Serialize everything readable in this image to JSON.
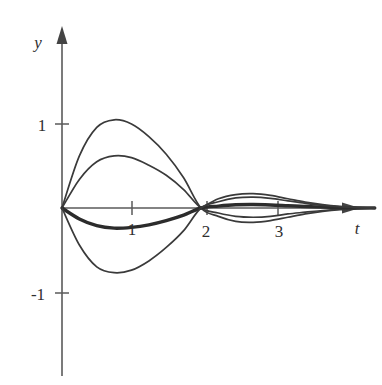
{
  "chart_data": {
    "type": "line",
    "title": "",
    "subtitle": "",
    "xlabel": "t",
    "ylabel": "y",
    "grid": false,
    "legend": "none",
    "xlim": [
      -0.35,
      4.45
    ],
    "ylim": [
      -2.0,
      2.1
    ],
    "x_ticks": [
      1,
      2,
      3
    ],
    "x_tick_labels": [
      "1",
      "2",
      "3"
    ],
    "y_ticks": [
      1,
      -1
    ],
    "y_tick_labels": [
      "1",
      "-1"
    ],
    "annotations": [
      "All solution curves pass through the common node at t = 2, y = 0",
      "Curves are damped oscillations decaying toward y = 0 as t increases"
    ],
    "series": [
      {
        "name": "amplitude-1.05",
        "emphasis": "normal",
        "x": [
          0,
          0.25,
          0.5,
          0.75,
          1.0,
          1.25,
          1.5,
          1.75,
          2.0,
          2.25,
          2.5,
          2.75,
          3.0,
          3.25,
          3.5,
          3.75,
          4.0,
          4.25,
          4.5
        ],
        "y": [
          0,
          0.62,
          0.96,
          1.05,
          1.0,
          0.85,
          0.64,
          0.36,
          0,
          -0.1,
          -0.16,
          -0.17,
          -0.15,
          -0.11,
          -0.07,
          -0.04,
          -0.02,
          -0.01,
          0
        ]
      },
      {
        "name": "amplitude-0.62",
        "emphasis": "normal",
        "x": [
          0,
          0.25,
          0.5,
          0.75,
          1.0,
          1.25,
          1.5,
          1.75,
          2.0,
          2.25,
          2.5,
          2.75,
          3.0,
          3.25,
          3.5,
          3.75,
          4.0,
          4.25,
          4.5
        ],
        "y": [
          0,
          0.34,
          0.55,
          0.62,
          0.6,
          0.51,
          0.39,
          0.22,
          0,
          -0.06,
          -0.1,
          -0.11,
          -0.1,
          -0.07,
          -0.05,
          -0.03,
          -0.015,
          -0.005,
          0
        ]
      },
      {
        "name": "amplitude-0.23-bold",
        "emphasis": "bold",
        "x": [
          0,
          0.25,
          0.5,
          0.75,
          1.0,
          1.25,
          1.5,
          1.75,
          2.0,
          2.25,
          2.5,
          2.75,
          3.0,
          3.25,
          3.5,
          3.75,
          4.0,
          4.25,
          4.5
        ],
        "y": [
          0,
          -0.13,
          -0.21,
          -0.24,
          -0.23,
          -0.2,
          -0.15,
          -0.085,
          0,
          0.023,
          0.038,
          0.041,
          0.036,
          0.027,
          0.018,
          0.01,
          0.005,
          0.002,
          0
        ]
      },
      {
        "name": "amplitude-negative-0.77",
        "emphasis": "normal",
        "x": [
          0,
          0.25,
          0.5,
          0.75,
          1.0,
          1.25,
          1.5,
          1.75,
          2.0,
          2.25,
          2.5,
          2.75,
          3.0,
          3.25,
          3.5,
          3.75,
          4.0,
          4.25,
          4.5
        ],
        "y": [
          0,
          -0.44,
          -0.7,
          -0.77,
          -0.74,
          -0.63,
          -0.47,
          -0.27,
          0,
          0.075,
          0.12,
          0.13,
          0.115,
          0.085,
          0.055,
          0.03,
          0.015,
          0.005,
          0
        ]
      },
      {
        "name": "amplitude-0.12-upper-lobe",
        "emphasis": "normal",
        "x": [
          2.0,
          2.25,
          2.5,
          2.75,
          3.0,
          3.25,
          3.5,
          3.75,
          4.0,
          4.25,
          4.5
        ],
        "y": [
          0,
          0.11,
          0.16,
          0.17,
          0.15,
          0.11,
          0.07,
          0.04,
          0.02,
          0.008,
          0
        ]
      }
    ]
  },
  "axes": {
    "y_axis_label": "y",
    "x_axis_label": "t",
    "y_tick_1": "1",
    "y_tick_neg1": "-1",
    "x_tick_1": "1",
    "x_tick_2": "2",
    "x_tick_3": "3"
  },
  "colors": {
    "curve": "#3a3a3a",
    "curve_bold": "#2c2c2c",
    "axis": "#5a5a5a",
    "label": "#2f2f2f",
    "background": "#ffffff"
  }
}
